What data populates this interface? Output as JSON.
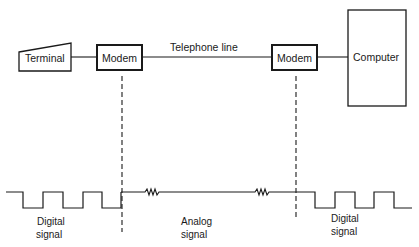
{
  "diagram": {
    "colors": {
      "ink": "#1a1a1a",
      "background": "#ffffff"
    },
    "nodes": {
      "terminal": {
        "label": "Terminal"
      },
      "modem_left": {
        "label": "Modem"
      },
      "modem_right": {
        "label": "Modem"
      },
      "computer": {
        "label": "Computer"
      }
    },
    "edges": {
      "telephone_line": {
        "label": "Telephone line"
      }
    },
    "signals": {
      "left": {
        "line1": "Digital",
        "line2": "signal",
        "type": "square-wave"
      },
      "middle": {
        "line1": "Analog",
        "line2": "signal",
        "type": "sine-wave"
      },
      "right": {
        "line1": "Digital",
        "line2": "signal",
        "type": "square-wave"
      }
    }
  }
}
